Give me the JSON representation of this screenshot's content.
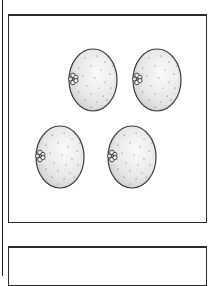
{
  "scene": {
    "description": "Worksheet-style illustration with four oranges in a bordered panel",
    "panels": [
      {
        "id": "top-panel",
        "contains": "oranges"
      },
      {
        "id": "bottom-panel",
        "contains": "empty"
      }
    ]
  },
  "oranges": {
    "count": 4,
    "items": [
      {
        "id": "orange-1",
        "cx": 93,
        "cy": 80
      },
      {
        "id": "orange-2",
        "cx": 157,
        "cy": 80
      },
      {
        "id": "orange-3",
        "cx": 60,
        "cy": 157
      },
      {
        "id": "orange-4",
        "cx": 132,
        "cy": 157
      }
    ],
    "rx": 24,
    "ry": 31,
    "stroke_color": "#3a3a3a",
    "fill_light": "#fafafa",
    "fill_dark": "#cfcfcf",
    "icon": "orange-icon",
    "stem_icon": "flower-stem-icon"
  },
  "colors": {
    "border": "#2a2a2a",
    "background": "#ffffff"
  }
}
